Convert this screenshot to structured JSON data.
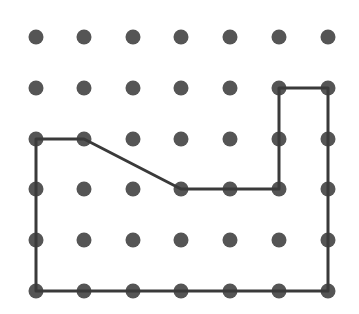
{
  "diagram": {
    "type": "dot-grid-polygon",
    "grid": {
      "columns": 7,
      "rows": 6,
      "x_positions": [
        36,
        84,
        133,
        181,
        230,
        279,
        328
      ],
      "y_positions": [
        37,
        88,
        139,
        189,
        240,
        291
      ],
      "dot_radius": 7.5,
      "dot_color": "#555555"
    },
    "polygon": {
      "vertices_grid": [
        [
          0,
          2
        ],
        [
          1,
          2
        ],
        [
          3,
          3
        ],
        [
          5,
          3
        ],
        [
          5,
          1
        ],
        [
          6,
          1
        ],
        [
          6,
          5
        ],
        [
          0,
          5
        ]
      ],
      "stroke_color": "#3a3a3a",
      "stroke_width": 3,
      "closed": true
    }
  }
}
